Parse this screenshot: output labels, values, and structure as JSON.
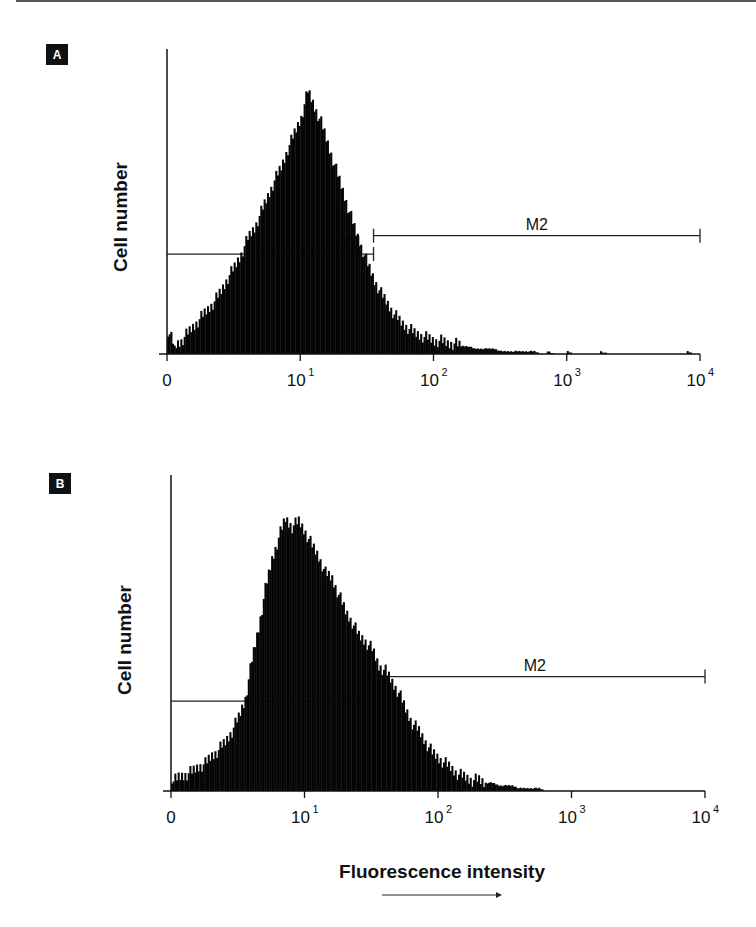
{
  "figure": {
    "x_axis_label": "Fluorescence intensity",
    "x_axis_arrow": "increasing-arrow"
  },
  "chart_data": [
    {
      "type": "area",
      "panel": "A",
      "title": "",
      "xlabel": "",
      "ylabel": "Cell number",
      "x_scale": "log",
      "x_decades": [
        0,
        4
      ],
      "x_ticks": [
        {
          "decade": 0,
          "base": "0",
          "exp": ""
        },
        {
          "decade": 1,
          "base": "10",
          "exp": "1"
        },
        {
          "decade": 2,
          "base": "10",
          "exp": "2"
        },
        {
          "decade": 3,
          "base": "10",
          "exp": "3"
        },
        {
          "decade": 4,
          "base": "10",
          "exp": "4"
        }
      ],
      "ylim": [
        0,
        116
      ],
      "grid": false,
      "markers": [
        {
          "label": "M1",
          "from_decade": 0,
          "to_decade": 1.55,
          "level": 38,
          "label_visible": true
        },
        {
          "label": "M2",
          "from_decade": 1.55,
          "to_decade": 4.0,
          "level": 45,
          "label_visible": true
        }
      ],
      "bin_width_decades": 0.05,
      "bins_relative_count": [
        9,
        3,
        5,
        8,
        11,
        14,
        17,
        20,
        24,
        29,
        33,
        38,
        44,
        48,
        54,
        60,
        66,
        71,
        78,
        84,
        90,
        100,
        94,
        88,
        80,
        72,
        64,
        56,
        48,
        41,
        34,
        28,
        23,
        19,
        15,
        12,
        10,
        8,
        7,
        6,
        5,
        5,
        4,
        4,
        3,
        3,
        2,
        2,
        2,
        2,
        1,
        1,
        1,
        1,
        1,
        1,
        0,
        1,
        0,
        0,
        1,
        0,
        0,
        0,
        0,
        1,
        0,
        0,
        0,
        0,
        0,
        0,
        0,
        0,
        0,
        0,
        0,
        0,
        1,
        0
      ]
    },
    {
      "type": "area",
      "panel": "B",
      "title": "",
      "xlabel": "Fluorescence intensity",
      "ylabel": "Cell number",
      "x_scale": "log",
      "x_decades": [
        0,
        4
      ],
      "x_ticks": [
        {
          "decade": 0,
          "base": "0",
          "exp": ""
        },
        {
          "decade": 1,
          "base": "10",
          "exp": "1"
        },
        {
          "decade": 2,
          "base": "10",
          "exp": "2"
        },
        {
          "decade": 3,
          "base": "10",
          "exp": "3"
        },
        {
          "decade": 4,
          "base": "10",
          "exp": "4"
        }
      ],
      "ylim": [
        0,
        116
      ],
      "grid": false,
      "markers": [
        {
          "label": "M1",
          "from_decade": 0,
          "to_decade": 1.45,
          "level": 33,
          "label_visible": false
        },
        {
          "label": "M2",
          "from_decade": 1.45,
          "to_decade": 4.0,
          "level": 42,
          "label_visible": true
        }
      ],
      "bin_width_decades": 0.05,
      "bins_relative_count": [
        3,
        5,
        6,
        7,
        9,
        10,
        13,
        15,
        18,
        22,
        27,
        34,
        48,
        60,
        74,
        85,
        93,
        100,
        97,
        99,
        95,
        90,
        86,
        80,
        78,
        72,
        66,
        62,
        57,
        55,
        52,
        46,
        44,
        40,
        36,
        30,
        25,
        22,
        18,
        14,
        12,
        10,
        8,
        6,
        5,
        4,
        4,
        3,
        3,
        2,
        2,
        2,
        1,
        1,
        1,
        1,
        0,
        0,
        0,
        0,
        0,
        0,
        0,
        0,
        0,
        0,
        0,
        0,
        0,
        0,
        0,
        0,
        0,
        0,
        0,
        0,
        0,
        0,
        0,
        0
      ]
    }
  ]
}
